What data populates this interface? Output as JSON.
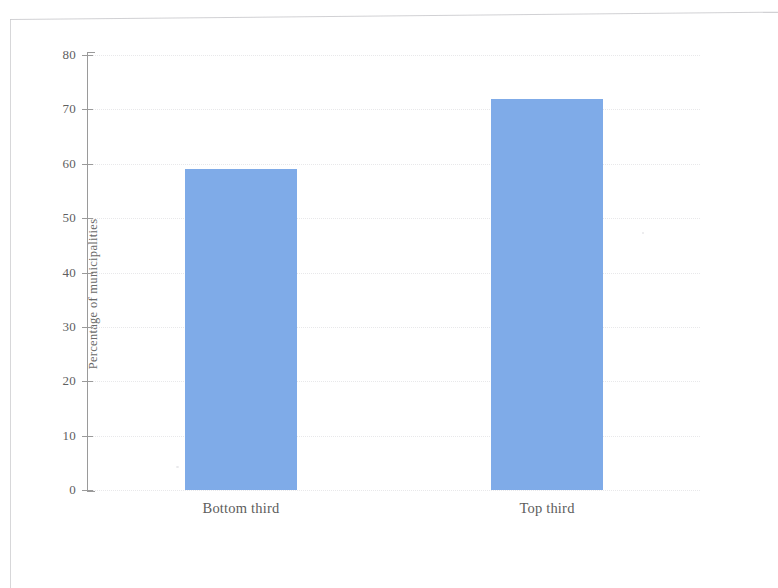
{
  "figure": {
    "background_color": "#ffffff",
    "frame_color": "#c9c9cc",
    "axis_color": "#9a9a9a",
    "bar_color": "#7fabe8",
    "gridline_color": "#e8e8ea"
  },
  "chart_data": {
    "type": "bar",
    "title": "",
    "subtitle": "",
    "xlabel": "",
    "ylabel": "Percentage of municipalities",
    "categories": [
      "Bottom third",
      "Top third"
    ],
    "values": [
      59,
      72
    ],
    "series": [
      {
        "name": "Percentage of municipalities",
        "values": [
          59,
          72
        ]
      }
    ],
    "ylim": [
      0,
      80
    ],
    "ytick_values": [
      0,
      10,
      20,
      30,
      40,
      50,
      60,
      70,
      80
    ],
    "ytick_labels": [
      "0",
      "10",
      "20",
      "30",
      "40",
      "50",
      "60",
      "70",
      "80"
    ],
    "grid": true,
    "grid_axis": "y",
    "legend": false,
    "legend_position": "none",
    "annotations": []
  }
}
